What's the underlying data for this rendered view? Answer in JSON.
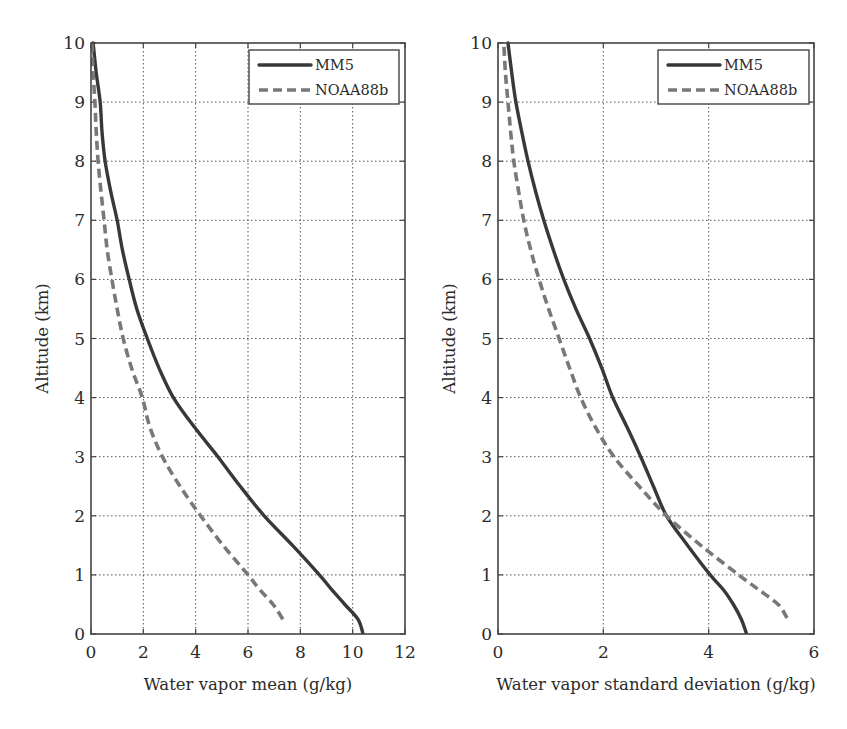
{
  "figure": {
    "legend": {
      "series": [
        {
          "name": "MM5",
          "style": "solid",
          "color": "#383838"
        },
        {
          "name": "NOAA88b",
          "style": "dashed",
          "color": "#787878"
        }
      ]
    }
  },
  "chart_data": [
    {
      "type": "line",
      "title": "",
      "xlabel": "Water vapor mean (g/kg)",
      "ylabel": "Altitude (km)",
      "xlim": [
        0,
        12
      ],
      "ylim": [
        0,
        10
      ],
      "xticks": [
        0,
        2,
        4,
        6,
        8,
        10,
        12
      ],
      "yticks": [
        0,
        1,
        2,
        3,
        4,
        5,
        6,
        7,
        8,
        9,
        10
      ],
      "grid": true,
      "legend_position": "upper right",
      "series": [
        {
          "name": "MM5",
          "style": "solid",
          "x": [
            10.4,
            10.2,
            9.7,
            9.2,
            8.73,
            7.7,
            6.62,
            5.7,
            4.85,
            3.95,
            3.15,
            2.6,
            2.15,
            1.75,
            1.46,
            1.2,
            1.0,
            0.75,
            0.54,
            0.42,
            0.35,
            0.2,
            0.08
          ],
          "y": [
            0,
            0.25,
            0.5,
            0.75,
            1.0,
            1.5,
            2.0,
            2.5,
            3.0,
            3.5,
            4.0,
            4.5,
            5.0,
            5.5,
            6.0,
            6.5,
            7.0,
            7.5,
            8.0,
            8.5,
            9.0,
            9.5,
            10.0
          ]
        },
        {
          "name": "NOAA88b",
          "style": "dashed",
          "x": [
            7.33,
            6.96,
            6.45,
            6.0,
            5.05,
            4.19,
            3.4,
            2.73,
            2.25,
            1.96,
            1.55,
            1.23,
            1.0,
            0.8,
            0.62,
            0.5,
            0.38,
            0.27,
            0.2,
            0.15,
            0.08,
            0.04
          ],
          "y": [
            0.25,
            0.5,
            0.75,
            1.0,
            1.5,
            2.0,
            2.5,
            3.0,
            3.5,
            4.0,
            4.5,
            5.0,
            5.5,
            6.0,
            6.5,
            7.0,
            7.5,
            8.0,
            8.5,
            9.0,
            9.5,
            10.0
          ]
        }
      ]
    },
    {
      "type": "line",
      "title": "",
      "xlabel": "Water vapor standard deviation (g/kg)",
      "ylabel": "Altitude (km)",
      "xlim": [
        0,
        6
      ],
      "ylim": [
        0,
        10
      ],
      "xticks": [
        0,
        2,
        4,
        6
      ],
      "yticks": [
        0,
        1,
        2,
        3,
        4,
        5,
        6,
        7,
        8,
        9,
        10
      ],
      "grid": true,
      "legend_position": "upper right",
      "series": [
        {
          "name": "MM5",
          "style": "solid",
          "x": [
            4.72,
            4.62,
            4.47,
            4.28,
            4.03,
            3.6,
            3.2,
            2.95,
            2.71,
            2.45,
            2.18,
            1.97,
            1.74,
            1.48,
            1.25,
            1.05,
            0.87,
            0.71,
            0.57,
            0.45,
            0.34,
            0.26,
            0.19
          ],
          "y": [
            0,
            0.25,
            0.5,
            0.75,
            1.0,
            1.5,
            2.0,
            2.5,
            3.0,
            3.5,
            4.0,
            4.5,
            5.0,
            5.5,
            6.0,
            6.5,
            7.0,
            7.5,
            8.0,
            8.5,
            9.0,
            9.5,
            10.0
          ]
        },
        {
          "name": "NOAA88b",
          "style": "dashed",
          "x": [
            5.49,
            5.32,
            4.95,
            4.57,
            3.85,
            3.2,
            2.68,
            2.2,
            1.85,
            1.57,
            1.36,
            1.16,
            0.96,
            0.78,
            0.62,
            0.49,
            0.39,
            0.3,
            0.24,
            0.19,
            0.14,
            0.11
          ],
          "y": [
            0.27,
            0.5,
            0.75,
            1.0,
            1.5,
            2.0,
            2.5,
            3.0,
            3.5,
            4.0,
            4.5,
            5.0,
            5.5,
            6.0,
            6.5,
            7.0,
            7.5,
            8.0,
            8.5,
            9.0,
            9.5,
            10.0
          ]
        }
      ]
    }
  ]
}
